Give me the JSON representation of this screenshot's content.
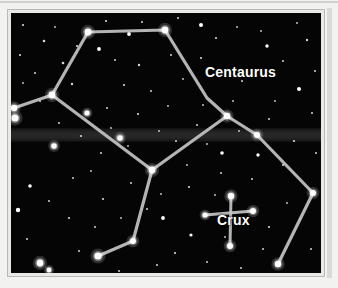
{
  "figure": {
    "kind": "star-chart",
    "background_color": "#050505",
    "frame_color": "#e9e9e7",
    "line_color": "#c8c8c8",
    "star_color": "#ffffff",
    "label_color": "#ffffff"
  },
  "labels": {
    "centaurus": "Centaurus",
    "crux": "Crux"
  },
  "chart_data": {
    "type": "scatter",
    "title": "",
    "xlabel": "",
    "ylabel": "",
    "grid": false,
    "legend": "none",
    "xlim": [
      0,
      310
    ],
    "ylim": [
      0,
      260
    ],
    "annotations": [
      {
        "text": "Centaurus",
        "x": 194,
        "y": 62
      },
      {
        "text": "Crux",
        "x": 206,
        "y": 210
      }
    ],
    "series": [
      {
        "name": "Centaurus constellation lines",
        "type": "line",
        "color": "#c8c8c8",
        "width": 3.2,
        "paths": [
          [
            [
              77,
              19
            ],
            [
              154,
              17
            ],
            [
              196,
              85
            ],
            [
              216,
              103
            ],
            [
              246,
              122
            ],
            [
              302,
              180
            ],
            [
              267,
              251
            ]
          ],
          [
            [
              3,
              95
            ],
            [
              41,
              82
            ],
            [
              77,
              19
            ]
          ],
          [
            [
              41,
              82
            ],
            [
              141,
              157
            ],
            [
              216,
              103
            ]
          ],
          [
            [
              141,
              157
            ],
            [
              122,
              228
            ],
            [
              87,
              243
            ]
          ]
        ]
      },
      {
        "name": "Crux constellation lines",
        "type": "line",
        "color": "#c8c8c8",
        "width": 3.0,
        "paths": [
          [
            [
              220,
              183
            ],
            [
              219,
              233
            ]
          ],
          [
            [
              194,
              202
            ],
            [
              242,
              198
            ]
          ]
        ]
      },
      {
        "name": "Centaurus node stars",
        "type": "scatter",
        "color": "#ffffff",
        "points": [
          {
            "x": 77,
            "y": 19,
            "r": 3.4
          },
          {
            "x": 154,
            "y": 17,
            "r": 3.4
          },
          {
            "x": 216,
            "y": 103,
            "r": 3.2
          },
          {
            "x": 246,
            "y": 122,
            "r": 3.0
          },
          {
            "x": 302,
            "y": 180,
            "r": 3.0
          },
          {
            "x": 267,
            "y": 251,
            "r": 3.2
          },
          {
            "x": 41,
            "y": 82,
            "r": 3.4
          },
          {
            "x": 3,
            "y": 95,
            "r": 3.2
          },
          {
            "x": 76,
            "y": 100,
            "r": 2.6
          },
          {
            "x": 109,
            "y": 125,
            "r": 2.8
          },
          {
            "x": 141,
            "y": 157,
            "r": 3.4
          },
          {
            "x": 122,
            "y": 228,
            "r": 3.0
          },
          {
            "x": 87,
            "y": 243,
            "r": 3.6
          }
        ]
      },
      {
        "name": "Crux stars",
        "type": "scatter",
        "color": "#ffffff",
        "points": [
          {
            "x": 220,
            "y": 183,
            "r": 3.2
          },
          {
            "x": 219,
            "y": 233,
            "r": 3.0
          },
          {
            "x": 194,
            "y": 202,
            "r": 2.6
          },
          {
            "x": 242,
            "y": 198,
            "r": 3.0
          }
        ]
      },
      {
        "name": "Bright field stars",
        "type": "scatter",
        "color": "#ffffff",
        "points": [
          {
            "x": 4,
            "y": 105,
            "r": 3.6
          },
          {
            "x": 43,
            "y": 133,
            "r": 2.8
          },
          {
            "x": 29,
            "y": 250,
            "r": 3.4
          },
          {
            "x": 38,
            "y": 257,
            "r": 2.4
          },
          {
            "x": 7,
            "y": 197,
            "r": 2.2
          },
          {
            "x": 19,
            "y": 173,
            "r": 1.8
          },
          {
            "x": 88,
            "y": 36,
            "r": 1.9
          },
          {
            "x": 118,
            "y": 21,
            "r": 1.9
          },
          {
            "x": 190,
            "y": 12,
            "r": 2.0
          },
          {
            "x": 256,
            "y": 33,
            "r": 1.7
          },
          {
            "x": 288,
            "y": 76,
            "r": 2.0
          },
          {
            "x": 211,
            "y": 140,
            "r": 1.8
          },
          {
            "x": 152,
            "y": 205,
            "r": 1.9
          },
          {
            "x": 180,
            "y": 222,
            "r": 1.6
          },
          {
            "x": 247,
            "y": 142,
            "r": 1.7
          }
        ]
      },
      {
        "name": "Faint field stars",
        "type": "scatter",
        "color": "#d6d6d6",
        "points": [
          {
            "x": 12,
            "y": 12,
            "r": 1.1
          },
          {
            "x": 33,
            "y": 28,
            "r": 1.3
          },
          {
            "x": 9,
            "y": 42,
            "r": 1.1
          },
          {
            "x": 24,
            "y": 60,
            "r": 1.0
          },
          {
            "x": 52,
            "y": 50,
            "r": 1.3
          },
          {
            "x": 66,
            "y": 33,
            "r": 1.1
          },
          {
            "x": 61,
            "y": 71,
            "r": 1.2
          },
          {
            "x": 29,
            "y": 88,
            "r": 1.0
          },
          {
            "x": 12,
            "y": 70,
            "r": 0.9
          },
          {
            "x": 44,
            "y": 14,
            "r": 0.9
          },
          {
            "x": 95,
            "y": 8,
            "r": 1.1
          },
          {
            "x": 131,
            "y": 9,
            "r": 1.0
          },
          {
            "x": 167,
            "y": 5,
            "r": 1.0
          },
          {
            "x": 205,
            "y": 25,
            "r": 1.1
          },
          {
            "x": 226,
            "y": 14,
            "r": 0.9
          },
          {
            "x": 240,
            "y": 57,
            "r": 1.0
          },
          {
            "x": 272,
            "y": 48,
            "r": 1.0
          },
          {
            "x": 296,
            "y": 27,
            "r": 1.2
          },
          {
            "x": 286,
            "y": 10,
            "r": 0.9
          },
          {
            "x": 304,
            "y": 58,
            "r": 1.0
          },
          {
            "x": 264,
            "y": 88,
            "r": 0.9
          },
          {
            "x": 301,
            "y": 100,
            "r": 1.0
          },
          {
            "x": 231,
            "y": 68,
            "r": 1.0
          },
          {
            "x": 190,
            "y": 45,
            "r": 1.1
          },
          {
            "x": 160,
            "y": 42,
            "r": 1.0
          },
          {
            "x": 128,
            "y": 52,
            "r": 1.2
          },
          {
            "x": 104,
            "y": 47,
            "r": 1.0
          },
          {
            "x": 113,
            "y": 72,
            "r": 1.1
          },
          {
            "x": 140,
            "y": 78,
            "r": 1.0
          },
          {
            "x": 172,
            "y": 66,
            "r": 0.9
          },
          {
            "x": 96,
            "y": 95,
            "r": 1.0
          },
          {
            "x": 127,
            "y": 101,
            "r": 1.1
          },
          {
            "x": 157,
            "y": 93,
            "r": 0.9
          },
          {
            "x": 186,
            "y": 112,
            "r": 1.0
          },
          {
            "x": 70,
            "y": 123,
            "r": 1.1
          },
          {
            "x": 90,
            "y": 140,
            "r": 1.0
          },
          {
            "x": 117,
            "y": 133,
            "r": 0.9
          },
          {
            "x": 165,
            "y": 128,
            "r": 1.0
          },
          {
            "x": 196,
            "y": 131,
            "r": 0.9
          },
          {
            "x": 228,
            "y": 118,
            "r": 0.9
          },
          {
            "x": 258,
            "y": 106,
            "r": 1.0
          },
          {
            "x": 283,
            "y": 128,
            "r": 1.1
          },
          {
            "x": 305,
            "y": 140,
            "r": 1.0
          },
          {
            "x": 272,
            "y": 152,
            "r": 1.1
          },
          {
            "x": 241,
            "y": 166,
            "r": 1.0
          },
          {
            "x": 210,
            "y": 160,
            "r": 1.0
          },
          {
            "x": 178,
            "y": 174,
            "r": 1.1
          },
          {
            "x": 150,
            "y": 181,
            "r": 0.9
          },
          {
            "x": 120,
            "y": 170,
            "r": 1.0
          },
          {
            "x": 92,
            "y": 186,
            "r": 1.1
          },
          {
            "x": 62,
            "y": 165,
            "r": 1.0
          },
          {
            "x": 38,
            "y": 188,
            "r": 1.0
          },
          {
            "x": 58,
            "y": 205,
            "r": 1.1
          },
          {
            "x": 84,
            "y": 214,
            "r": 1.0
          },
          {
            "x": 110,
            "y": 205,
            "r": 0.9
          },
          {
            "x": 136,
            "y": 196,
            "r": 1.0
          },
          {
            "x": 164,
            "y": 240,
            "r": 1.1
          },
          {
            "x": 196,
            "y": 249,
            "r": 1.0
          },
          {
            "x": 230,
            "y": 255,
            "r": 1.0
          },
          {
            "x": 258,
            "y": 214,
            "r": 1.1
          },
          {
            "x": 289,
            "y": 206,
            "r": 1.0
          },
          {
            "x": 300,
            "y": 236,
            "r": 1.0
          },
          {
            "x": 276,
            "y": 190,
            "r": 0.9
          },
          {
            "x": 252,
            "y": 236,
            "r": 1.0
          },
          {
            "x": 204,
            "y": 182,
            "r": 0.9
          },
          {
            "x": 176,
            "y": 152,
            "r": 0.9
          },
          {
            "x": 146,
            "y": 252,
            "r": 1.0
          },
          {
            "x": 108,
            "y": 258,
            "r": 1.0
          },
          {
            "x": 68,
            "y": 238,
            "r": 1.0
          },
          {
            "x": 16,
            "y": 226,
            "r": 1.0
          },
          {
            "x": 48,
            "y": 110,
            "r": 1.0
          },
          {
            "x": 80,
            "y": 158,
            "r": 0.9
          },
          {
            "x": 222,
            "y": 88,
            "r": 0.9
          },
          {
            "x": 250,
            "y": 18,
            "r": 0.9
          },
          {
            "x": 148,
            "y": 118,
            "r": 0.9
          },
          {
            "x": 100,
            "y": 115,
            "r": 0.9
          },
          {
            "x": 214,
            "y": 224,
            "r": 0.9
          },
          {
            "x": 192,
            "y": 92,
            "r": 0.9
          }
        ]
      }
    ],
    "milky_way_band": {
      "y_center": 122,
      "height": 14,
      "color": "#2a2a2a"
    }
  }
}
